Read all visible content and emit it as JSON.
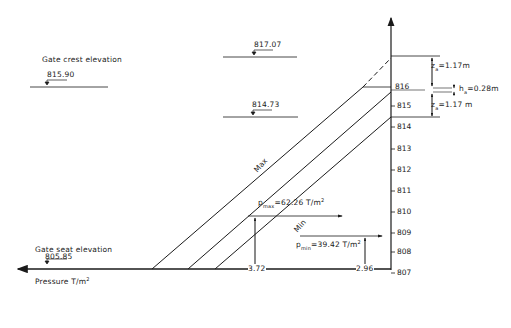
{
  "diagram": {
    "type": "hydrostatic pressure distribution on gate",
    "axis": {
      "horizontal_label": "Pressure T/m",
      "horizontal_label_sup": "2",
      "elevation_ticks": [
        "816",
        "815",
        "814",
        "813",
        "812",
        "811",
        "810",
        "809",
        "808",
        "807"
      ]
    },
    "elevations": {
      "gate_crest_label": "Gate crest elevation",
      "gate_crest_value": "815.90",
      "upper_water_value": "817.07",
      "lower_water_value": "814.73",
      "gate_seat_label": "Gate seat elevation",
      "gate_seat_value": "805.85"
    },
    "lines": {
      "max_label": "Max",
      "min_label": "Min"
    },
    "annotations": {
      "za_top": "z",
      "za_top_sub": "a",
      "za_top_val": "=1.17m",
      "ha": "h",
      "ha_sub": "a",
      "ha_val": "=0.28m",
      "za_bottom": "z",
      "za_bottom_sub": "a",
      "za_bottom_val": "=1.17 m",
      "pmax": "p",
      "pmax_sub": "max",
      "pmax_val": "=62.26 T/m",
      "pmax_sup": "2",
      "pmin": "p",
      "pmin_sub": "min",
      "pmin_val": "=39.42 T/m",
      "pmin_sup": "2",
      "dim_left": "3.72",
      "dim_right": "2.96"
    }
  }
}
